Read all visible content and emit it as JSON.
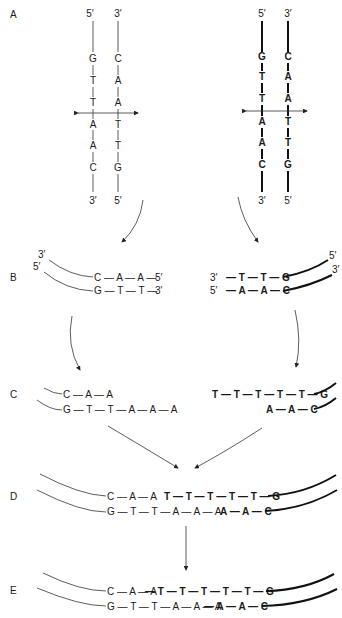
{
  "panels": {
    "A": {
      "label": "A",
      "left_duplex": {
        "strand1_top": "5′",
        "strand1_bottom": "3′",
        "strand1_bases": [
          "G",
          "T",
          "T",
          "A",
          "A",
          "C"
        ],
        "strand2_top": "3′",
        "strand2_bottom": "5′",
        "strand2_bases": [
          "C",
          "A",
          "A",
          "T",
          "T",
          "G"
        ]
      },
      "right_duplex": {
        "strand1_top": "5′",
        "strand1_bottom": "3′",
        "strand1_bases": [
          "G",
          "T",
          "T",
          "A",
          "A",
          "C"
        ],
        "strand2_top": "3′",
        "strand2_bottom": "5′",
        "strand2_bases": [
          "C",
          "A",
          "A",
          "T",
          "T",
          "G"
        ]
      }
    },
    "B": {
      "label": "B",
      "left": {
        "top_end_left": "3′",
        "bottom_end_left": "5′",
        "top_seq": "C — A — A —",
        "top_end_right": "5′",
        "bottom_seq": "G — T — T —",
        "bottom_end_right": "3′"
      },
      "right": {
        "top_end_left": "3′",
        "bottom_end_left": "5′",
        "top_seq": "— T — T — G",
        "top_end_right": "5′",
        "bottom_seq": "— A — A — C",
        "bottom_end_right": "3′"
      }
    },
    "C": {
      "label": "C",
      "left_top": "C — A — A",
      "left_bottom": "G — T — T — A — A — A",
      "right_top": "T — T — T — T — T — G",
      "right_bottom": "A — A — C"
    },
    "D": {
      "label": "D",
      "top_left": "C — A — A",
      "top_right": "T — T — T — T — T — G",
      "bottom_left": "G — T — T — A — A — A",
      "bottom_right": "A — A — C"
    },
    "E": {
      "label": "E",
      "top_thin": "C — A — A",
      "top_bold": "— T — T — T — T — T — G",
      "bottom_thin": "G — T — T — A — A — A",
      "bottom_bold": "— A — A — C"
    }
  }
}
